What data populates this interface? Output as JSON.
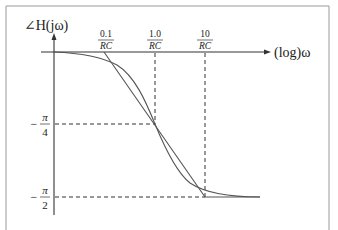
{
  "diagram": {
    "y_axis_label": "∠H(jω)",
    "x_axis_label": "(log)ω",
    "x_ticks": [
      {
        "numerator": "0.1",
        "denominator": "RC"
      },
      {
        "numerator": "1.0",
        "denominator": "RC"
      },
      {
        "numerator": "10",
        "denominator": "RC"
      }
    ],
    "y_ticks": [
      {
        "sign": "−",
        "numerator": "π",
        "denominator": "4"
      },
      {
        "sign": "−",
        "numerator": "π",
        "denominator": "2"
      }
    ],
    "curves": [
      {
        "name": "exact-phase-curve",
        "description": "smooth arctan phase curve"
      },
      {
        "name": "asymptotic-approximation",
        "description": "straight-line approximation from 0.1/RC to 10/RC"
      }
    ],
    "colors": {
      "line": "#555555",
      "axis": "#333333",
      "frame": "#888888"
    }
  }
}
